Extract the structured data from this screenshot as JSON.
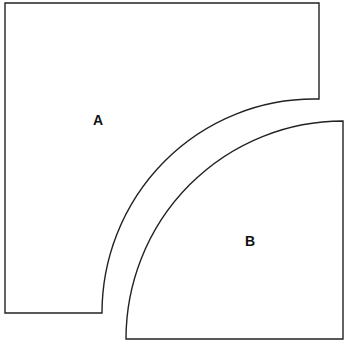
{
  "diagram": {
    "shapes": [
      {
        "id": "A",
        "label": "A",
        "description": "Square with quarter-circle concave cut at bottom-right"
      },
      {
        "id": "B",
        "label": "B",
        "description": "Quarter-circle sector (convex arc at top-left)"
      }
    ],
    "stroke_color": "#222222",
    "background": "#ffffff"
  }
}
